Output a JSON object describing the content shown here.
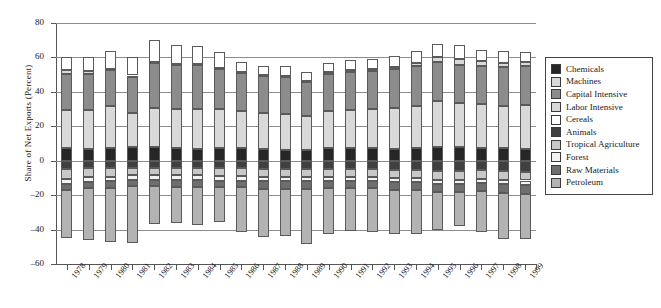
{
  "chart_data": {
    "type": "bar",
    "subtype": "stacked-bar-diverging",
    "title": "",
    "xlabel": "",
    "ylabel": "Share of Net Exports (Percent)",
    "ylim": [
      -60,
      80
    ],
    "ytick_step": 20,
    "yticks": [
      80,
      60,
      40,
      20,
      0,
      -20,
      -40,
      -60
    ],
    "grid": true,
    "legend_position": "right",
    "categories": [
      "1978",
      "1979",
      "1980",
      "1981",
      "1982",
      "1983",
      "1984",
      "1985",
      "1986",
      "1987",
      "1988",
      "1989",
      "1990",
      "1991",
      "1992",
      "1993",
      "1994",
      "1995",
      "1996",
      "1997",
      "1998",
      "1999"
    ],
    "series": [
      {
        "name": "Chemicals",
        "color": "#262626",
        "values": [
          7.5,
          7.0,
          7.5,
          8.0,
          8.0,
          7.5,
          7.0,
          7.5,
          7.5,
          7.0,
          6.5,
          6.0,
          7.5,
          7.5,
          7.5,
          7.0,
          7.5,
          8.0,
          8.0,
          7.5,
          7.5,
          7.0
        ]
      },
      {
        "name": "Machines",
        "color": "#d9d9d9",
        "values": [
          22.0,
          22.5,
          24.5,
          19.5,
          22.5,
          22.5,
          23.0,
          22.5,
          21.5,
          21.0,
          20.5,
          20.0,
          21.5,
          22.0,
          22.5,
          23.5,
          24.5,
          26.5,
          25.5,
          25.5,
          24.5,
          25.5
        ]
      },
      {
        "name": "Capital Intensive",
        "color": "#8c8c8c",
        "values": [
          21.0,
          21.0,
          20.5,
          21.0,
          26.5,
          25.5,
          25.5,
          23.5,
          22.0,
          21.5,
          21.5,
          20.0,
          21.5,
          22.0,
          22.0,
          22.5,
          23.0,
          23.0,
          22.0,
          22.0,
          22.5,
          22.5
        ]
      },
      {
        "name": "Labor Intensive",
        "color": "#d9d9d9",
        "values": [
          2.0,
          1.5,
          1.0,
          1.0,
          0.5,
          0.5,
          0.5,
          0.5,
          0.5,
          0.5,
          0.5,
          0.5,
          1.0,
          1.0,
          1.0,
          1.5,
          1.5,
          2.5,
          3.5,
          3.0,
          2.5,
          2.5
        ]
      },
      {
        "name": "Cereals",
        "color": "#ffffff",
        "values": [
          8.0,
          8.0,
          10.5,
          11.0,
          12.5,
          11.0,
          10.5,
          9.0,
          6.0,
          5.0,
          6.0,
          5.0,
          5.5,
          6.0,
          6.0,
          6.5,
          7.0,
          8.0,
          8.5,
          6.5,
          6.5,
          5.5
        ]
      },
      {
        "name": "Animals",
        "color": "#404040",
        "values": [
          -5.0,
          -4.5,
          -4.5,
          -4.5,
          -4.5,
          -4.5,
          -4.5,
          -4.5,
          -4.5,
          -5.0,
          -5.0,
          -5.0,
          -5.0,
          -5.0,
          -5.0,
          -5.5,
          -5.5,
          -6.0,
          -6.0,
          -5.5,
          -6.0,
          -6.5
        ]
      },
      {
        "name": "Tropical Agriculture",
        "color": "#c8c8c8",
        "values": [
          -5.5,
          -5.0,
          -5.0,
          -4.0,
          -4.0,
          -4.0,
          -4.0,
          -4.5,
          -4.5,
          -4.5,
          -4.5,
          -4.5,
          -4.5,
          -4.5,
          -4.5,
          -4.5,
          -4.5,
          -5.0,
          -5.0,
          -5.0,
          -5.0,
          -5.0
        ]
      },
      {
        "name": "Forest",
        "color": "#f2f2f2",
        "values": [
          -3.0,
          -3.0,
          -2.5,
          -2.5,
          -2.5,
          -2.5,
          -2.5,
          -2.5,
          -2.5,
          -2.5,
          -2.5,
          -2.5,
          -2.5,
          -2.5,
          -2.5,
          -2.5,
          -2.5,
          -2.5,
          -2.5,
          -2.5,
          -2.5,
          -2.5
        ]
      },
      {
        "name": "Raw Materials",
        "color": "#6e6e6e",
        "values": [
          -3.5,
          -3.5,
          -4.0,
          -3.5,
          -3.5,
          -4.0,
          -4.0,
          -4.0,
          -4.0,
          -4.5,
          -4.5,
          -4.5,
          -4.0,
          -4.0,
          -4.0,
          -4.5,
          -4.5,
          -4.5,
          -4.5,
          -4.5,
          -5.0,
          -5.5
        ]
      },
      {
        "name": "Petroleum",
        "color": "#b3b3b3",
        "values": [
          -28.0,
          -30.0,
          -31.5,
          -33.5,
          -22.5,
          -21.0,
          -22.5,
          -20.0,
          -26.0,
          -28.0,
          -27.5,
          -32.0,
          -26.5,
          -25.0,
          -25.5,
          -25.5,
          -25.5,
          -22.0,
          -20.0,
          -24.0,
          -27.0,
          -26.0
        ]
      }
    ]
  },
  "legend": {
    "items": [
      {
        "label": "Chemicals",
        "color": "#262626"
      },
      {
        "label": "Machines",
        "color": "#d9d9d9"
      },
      {
        "label": "Capital Intensive",
        "color": "#8c8c8c"
      },
      {
        "label": "Labor Intensive",
        "color": "#d9d9d9"
      },
      {
        "label": "Cereals",
        "color": "#ffffff"
      },
      {
        "label": "Animals",
        "color": "#404040"
      },
      {
        "label": "Tropical Agriculture",
        "color": "#c8c8c8"
      },
      {
        "label": "Forest",
        "color": "#f2f2f2"
      },
      {
        "label": "Raw Materials",
        "color": "#6e6e6e"
      },
      {
        "label": "Petroleum",
        "color": "#b3b3b3"
      }
    ]
  }
}
